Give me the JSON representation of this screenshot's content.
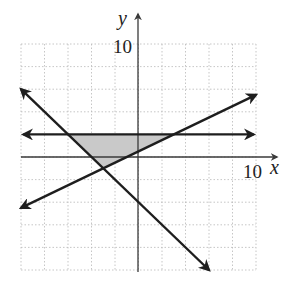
{
  "chart_data": {
    "type": "line",
    "title": "",
    "xlabel": "x",
    "ylabel": "y",
    "xlim": [
      -10,
      10
    ],
    "ylim": [
      -10,
      10
    ],
    "grid": true,
    "grid_step": 2,
    "tick_labels": {
      "x": [
        "10"
      ],
      "y": [
        "10"
      ]
    },
    "series": [
      {
        "name": "horizontal line",
        "equation": "y = 2",
        "points": [
          [
            -9.8,
            2
          ],
          [
            9.8,
            2
          ]
        ],
        "arrows": "both"
      },
      {
        "name": "increasing line",
        "equation": "y = 0.5x + 0.5",
        "points": [
          [
            -10,
            -4.5
          ],
          [
            10,
            5.5
          ]
        ],
        "arrows": "both"
      },
      {
        "name": "decreasing line",
        "equation": "y = -x - 4",
        "points": [
          [
            -10,
            6
          ],
          [
            6,
            -10
          ]
        ],
        "arrows": "both"
      }
    ],
    "shaded_region": {
      "vertices": [
        [
          -6,
          2
        ],
        [
          3,
          2
        ],
        [
          -3,
          -1
        ]
      ],
      "color": "#c9c9c9"
    }
  },
  "labels": {
    "x_axis": "x",
    "y_axis": "y",
    "x_tick": "10",
    "y_tick": "10"
  }
}
